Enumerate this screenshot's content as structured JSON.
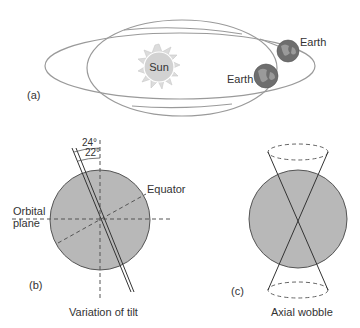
{
  "panel_a": {
    "tag": "(a)",
    "sun_label": "Sun",
    "earth_label_1": "Earth",
    "earth_label_2": "Earth"
  },
  "panel_b": {
    "tag": "(b)",
    "angle_outer": "24°",
    "angle_inner": "22°",
    "equator_label": "Equator",
    "orbital_label_line1": "Orbital",
    "orbital_label_line2": "plane",
    "caption": "Variation of tilt"
  },
  "panel_c": {
    "tag": "(c)",
    "caption": "Axial wobble"
  },
  "colors": {
    "planet_fill": "#b8b8b8",
    "outline": "#555555",
    "orbit_line": "#9a9a9a",
    "sun_fill": "#d6d6d6",
    "earth_fill": "#6e6e6e"
  }
}
